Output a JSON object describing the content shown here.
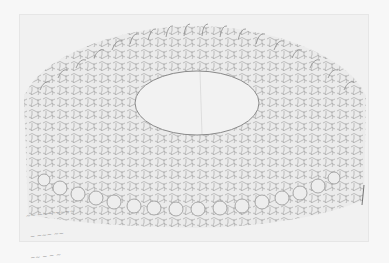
{
  "artwork": {
    "description": "Pencil sketch on paper: tessellated figures arranged in concentric rings around a blank oval, forming a fan/dome shape",
    "medium": "pencil on paper",
    "inscription_lines": [
      "~~ ~~~ ~~~~",
      " ~ ~~~ ~~",
      "~~ ~ ~ ~"
    ],
    "colors": {
      "background": "#f7f7f7",
      "paper": "#ebebeb",
      "pencil": "#8a8a8a",
      "oval": "#f2f2f2"
    }
  }
}
